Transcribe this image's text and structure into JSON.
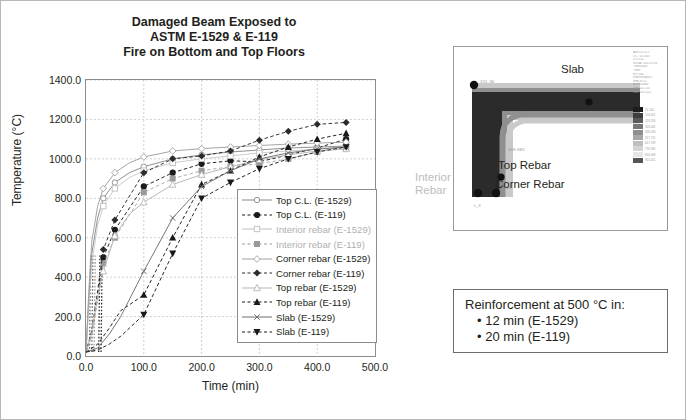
{
  "chart_data": {
    "type": "line",
    "title": [
      "Damaged Beam Exposed to",
      "ASTM E-1529 & E-119",
      "Fire on Bottom and Top Floors"
    ],
    "xlabel": "Time (min)",
    "ylabel": "Temperature (°C)",
    "xlim": [
      0,
      500
    ],
    "ylim": [
      0,
      1400
    ],
    "xticks": [
      "0.0",
      "100.0",
      "200.0",
      "300.0",
      "400.0",
      "500.0"
    ],
    "yticks": [
      "0.0",
      "200.0",
      "400.0",
      "600.0",
      "800.0",
      "1000.0",
      "1200.0",
      "1400.0"
    ],
    "grid": true,
    "legend_position": "inside-lower-right",
    "series": [
      {
        "name": "Top C.L. (E-1529)",
        "marker": "circle-open",
        "line": "solid",
        "color": "#8a8a8a",
        "dim": false,
        "x": [
          0,
          5,
          10,
          20,
          30,
          50,
          75,
          100,
          150,
          200,
          250,
          300,
          350,
          400,
          450
        ],
        "y": [
          20,
          300,
          520,
          700,
          800,
          880,
          930,
          960,
          1000,
          1020,
          1035,
          1045,
          1055,
          1060,
          1065
        ]
      },
      {
        "name": "Top C.L. (E-119)",
        "marker": "circle-filled",
        "line": "dashed",
        "color": "#1a1a1a",
        "dim": false,
        "x": [
          0,
          10,
          20,
          30,
          50,
          100,
          150,
          200,
          250,
          300,
          350,
          400,
          450
        ],
        "y": [
          20,
          120,
          300,
          500,
          640,
          860,
          930,
          975,
          990,
          985,
          1020,
          1055,
          1100
        ]
      },
      {
        "name": "Interior rebar (E-1529)",
        "marker": "square-open",
        "line": "solid",
        "color": "#bfbfbf",
        "dim": true,
        "x": [
          0,
          5,
          10,
          20,
          30,
          50,
          75,
          100,
          150,
          200,
          250,
          300,
          350,
          400,
          450
        ],
        "y": [
          20,
          260,
          470,
          660,
          760,
          850,
          905,
          940,
          980,
          1000,
          1015,
          1030,
          1040,
          1050,
          1055
        ]
      },
      {
        "name": "Interior rebar (E-119)",
        "marker": "square-filled",
        "line": "dashed",
        "color": "#9a9a9a",
        "dim": true,
        "x": [
          0,
          10,
          20,
          30,
          50,
          100,
          150,
          200,
          250,
          300,
          350,
          400,
          450
        ],
        "y": [
          20,
          110,
          280,
          470,
          600,
          830,
          900,
          940,
          960,
          975,
          1000,
          1035,
          1070
        ]
      },
      {
        "name": "Corner rebar (E-1529)",
        "marker": "diamond-open",
        "line": "solid",
        "color": "#a0a0a0",
        "dim": false,
        "x": [
          0,
          5,
          10,
          20,
          30,
          50,
          75,
          100,
          150,
          200,
          250,
          300,
          350,
          400,
          450
        ],
        "y": [
          20,
          340,
          580,
          760,
          850,
          930,
          980,
          1010,
          1040,
          1052,
          1060,
          1068,
          1075,
          1080,
          1085
        ]
      },
      {
        "name": "Corner rebar (E-119)",
        "marker": "diamond-filled",
        "line": "dashed",
        "color": "#2b2b2b",
        "dim": false,
        "x": [
          0,
          10,
          20,
          30,
          50,
          100,
          150,
          200,
          250,
          300,
          350,
          400,
          450
        ],
        "y": [
          20,
          130,
          330,
          540,
          690,
          930,
          1000,
          1015,
          1040,
          1095,
          1140,
          1175,
          1185
        ]
      },
      {
        "name": "Top rebar (E-1529)",
        "marker": "triangle-open",
        "line": "solid",
        "color": "#b5b5b5",
        "dim": false,
        "x": [
          0,
          10,
          20,
          30,
          50,
          75,
          100,
          150,
          200,
          250,
          300,
          350,
          400,
          450
        ],
        "y": [
          20,
          120,
          300,
          430,
          610,
          720,
          780,
          870,
          920,
          960,
          995,
          1020,
          1040,
          1050
        ]
      },
      {
        "name": "Top rebar (E-119)",
        "marker": "triangle-filled",
        "line": "dashed",
        "color": "#1a1a1a",
        "dim": false,
        "x": [
          0,
          20,
          40,
          60,
          100,
          150,
          200,
          250,
          300,
          350,
          400,
          450
        ],
        "y": [
          20,
          60,
          140,
          230,
          310,
          600,
          870,
          940,
          1010,
          1060,
          1100,
          1130
        ]
      },
      {
        "name": "Slab (E-1529)",
        "marker": "cross",
        "line": "solid",
        "color": "#6f6f6f",
        "dim": false,
        "x": [
          0,
          20,
          40,
          60,
          100,
          150,
          200,
          250,
          300,
          350,
          400,
          450
        ],
        "y": [
          20,
          40,
          110,
          200,
          430,
          700,
          860,
          940,
          1000,
          1030,
          1050,
          1060
        ]
      },
      {
        "name": "Slab (E-119)",
        "marker": "inv-triangle-filled",
        "line": "dashed",
        "color": "#1a1a1a",
        "dim": false,
        "x": [
          0,
          20,
          40,
          60,
          100,
          150,
          200,
          250,
          300,
          350,
          400,
          450
        ],
        "y": [
          20,
          30,
          60,
          100,
          210,
          520,
          800,
          880,
          950,
          1000,
          1035,
          1060
        ]
      }
    ]
  },
  "fea_panel": {
    "labels": {
      "slab": "Slab",
      "top_rebar": "Top Rebar",
      "corner_rebar": "Corner Rebar",
      "interior_rebar": "Interior\nRebar"
    },
    "header_lines": [
      "ANSYS 5.0.1",
      "OCT 10 2003",
      "13:25:41",
      "NODAL SOLUTION",
      "TIME=4800",
      "TEMP",
      "RSYS=0",
      "PowerGraphics",
      "EFACET=1",
      "AVRES=Mat",
      "SMN =21.105",
      "SMX =915.411"
    ],
    "colorbar": [
      {
        "color": "#1c1c1c",
        "value": "21.105"
      },
      {
        "color": "#3d3d3d",
        "value": "120.611"
      },
      {
        "color": "#5a5a5a",
        "value": "219.254"
      },
      {
        "color": "#767676",
        "value": "318.401"
      },
      {
        "color": "#909090",
        "value": "418.234"
      },
      {
        "color": "#a8a8a8",
        "value": "517.711"
      },
      {
        "color": "#bfbfbf",
        "value": "617.139"
      },
      {
        "color": "#d4d4d4",
        "value": "716.581"
      },
      {
        "color": "#e6e6e6",
        "value": "816.009"
      },
      {
        "color": "#555555",
        "value": "915.411"
      }
    ]
  },
  "callout": {
    "title": "Reinforcement at 500 °C in:",
    "items": [
      "• 12 min (E-1529)",
      "• 20 min (E-119)"
    ]
  },
  "colors": {
    "frame_border": "#b7b7b7",
    "plot_border": "#8d8d8d",
    "grid": "#bdbdbd",
    "text": "#231f20",
    "dim_text": "#bdbdbd"
  }
}
